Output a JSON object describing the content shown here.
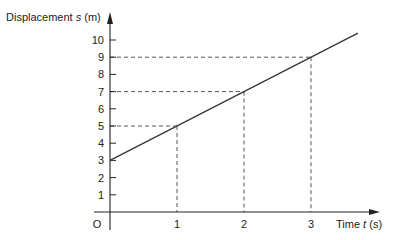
{
  "chart_data": {
    "type": "line",
    "title": "",
    "xlabel": "Time t (s)",
    "ylabel": "Displacement s (m)",
    "xlabel_parts": {
      "pre": "Time ",
      "var": "t",
      "post": " (s)"
    },
    "ylabel_parts": {
      "pre": "Displacement ",
      "var": "s",
      "post": " (m)"
    },
    "origin_label": "O",
    "x_ticks": [
      1,
      2,
      3
    ],
    "y_ticks": [
      1,
      2,
      3,
      4,
      5,
      6,
      7,
      8,
      9,
      10
    ],
    "xlim": [
      0,
      3.7
    ],
    "ylim": [
      0,
      10.4
    ],
    "grid": false,
    "series": [
      {
        "name": "s = 3 + 2t",
        "x": [
          0,
          3.7
        ],
        "y": [
          3,
          10.4
        ]
      }
    ],
    "highlighted_points": [
      {
        "t": 1,
        "s": 5
      },
      {
        "t": 2,
        "s": 7
      },
      {
        "t": 3,
        "s": 9
      }
    ],
    "annotations": "Dashed projection lines from points (1,5), (2,7), (3,9) to both axes"
  },
  "colors": {
    "axis": "#222222",
    "line": "#333333",
    "dashed": "#444444"
  }
}
